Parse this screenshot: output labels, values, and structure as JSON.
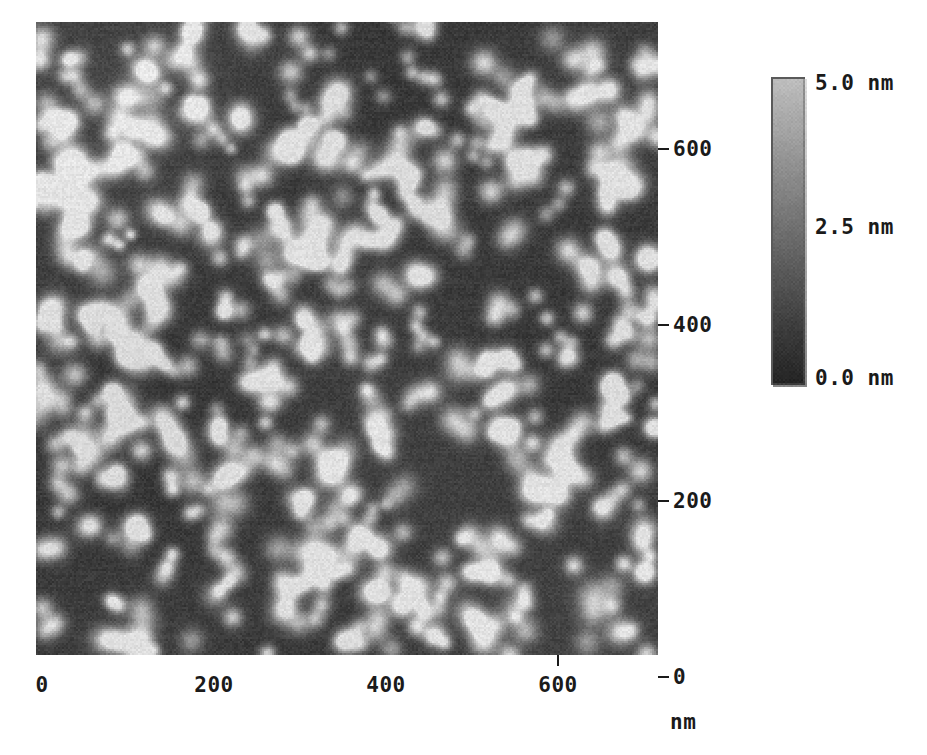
{
  "figure": {
    "type": "afm-topography-image"
  },
  "x_axis": {
    "unit_label": "nm",
    "ticks": [
      {
        "value": 0,
        "label": "0"
      },
      {
        "value": 200,
        "label": "200"
      },
      {
        "value": 400,
        "label": "400"
      },
      {
        "value": 600,
        "label": "600"
      }
    ],
    "range": [
      0,
      720
    ]
  },
  "y_axis": {
    "ticks": [
      {
        "value": 0,
        "label": "0"
      },
      {
        "value": 200,
        "label": "200"
      },
      {
        "value": 400,
        "label": "400"
      },
      {
        "value": 600,
        "label": "600"
      }
    ],
    "range": [
      0,
      720
    ]
  },
  "colorbar": {
    "orientation": "vertical",
    "colormap": "grayscale",
    "high_color": "#bfbfbf",
    "low_color": "#242424",
    "labels": {
      "top": "5.0 nm",
      "middle": "2.5 nm",
      "bottom": "0.0 nm"
    },
    "range_nm": [
      0.0,
      5.0
    ]
  },
  "chart_data": {
    "type": "heatmap",
    "title": "",
    "xlabel": "nm",
    "ylabel": "",
    "xlim": [
      0,
      720
    ],
    "ylim": [
      0,
      720
    ],
    "zlim": [
      0.0,
      5.0
    ],
    "zunit": "nm",
    "colormap": "gray",
    "grid": false,
    "legend": "colorbar-right",
    "xticks": [
      0,
      200,
      400,
      600
    ],
    "yticks": [
      0,
      200,
      400,
      600
    ],
    "background_height_nm": 0.6,
    "particle_height_nm": 3.4,
    "particle_count": 470,
    "particle_mean_diameter_nm": 22
  }
}
